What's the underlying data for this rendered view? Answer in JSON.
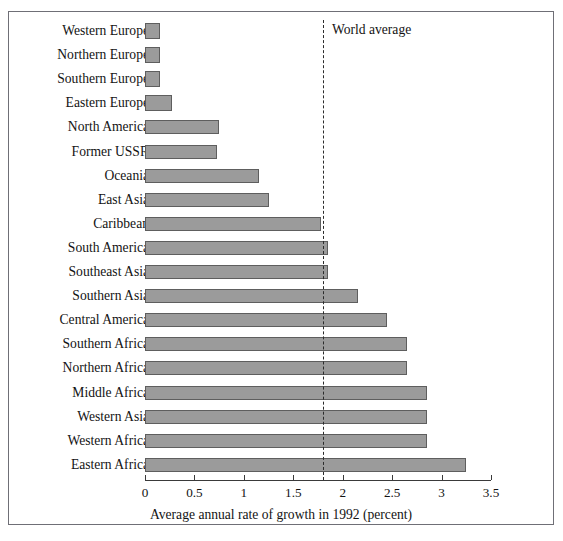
{
  "top_sliver_text": "",
  "chart_data": {
    "type": "bar",
    "orientation": "horizontal",
    "title": "",
    "xlabel": "Average annual rate of growth in 1992 (percent)",
    "ylabel": "",
    "xlim": [
      0,
      3.5
    ],
    "xticks": [
      0,
      0.5,
      1,
      1.5,
      2,
      2.5,
      3,
      3.5
    ],
    "xtick_labels": [
      "0",
      "0.5",
      "1",
      "1.5",
      "2",
      "2.5",
      "3",
      "3.5"
    ],
    "grid": false,
    "legend": null,
    "bar_fill_color": "#9b9b9b",
    "bar_border_color": "#5e5e5e",
    "annotations": [
      {
        "name": "world-average",
        "label": "World average",
        "value": 1.8,
        "style": "dashed-vertical-line",
        "color": "#2b2b2b"
      }
    ],
    "categories": [
      "Western Europe",
      "Northern Europe",
      "Southern Europe",
      "Eastern Europe",
      "North America",
      "Former USSR",
      "Oceania",
      "East Asia",
      "Caribbean",
      "South America",
      "Southeast Asia",
      "Southern Asia",
      "Central America",
      "Southern Africa",
      "Northern Africa",
      "Middle Africa",
      "Western Asia",
      "Western Africa",
      "Eastern Africa"
    ],
    "values": [
      0.15,
      0.15,
      0.15,
      0.27,
      0.75,
      0.73,
      1.15,
      1.25,
      1.78,
      1.85,
      1.85,
      2.15,
      2.45,
      2.65,
      2.65,
      2.85,
      2.85,
      2.85,
      3.25
    ]
  }
}
